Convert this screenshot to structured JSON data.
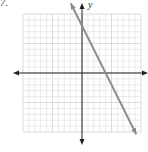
{
  "problem_label": "7.",
  "chart_data": {
    "type": "line",
    "title": "",
    "xlabel": "",
    "ylabel": "y",
    "xlim": [
      -10,
      10
    ],
    "ylim": [
      -10,
      10
    ],
    "grid": true,
    "grid_step": 1,
    "series": [
      {
        "name": "line",
        "equation": "y = -2x + 8",
        "slope": -2,
        "y_intercept": 8,
        "x_intercept": 4,
        "x": [
          -1.9,
          9.2
        ],
        "y": [
          11.8,
          -10.4
        ],
        "color": "#8a8a8a"
      }
    ],
    "axis_color": "#222222",
    "grid_color": "#d8d8d8"
  }
}
